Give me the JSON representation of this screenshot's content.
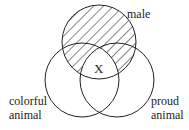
{
  "diagram": {
    "type": "venn",
    "sets": [
      {
        "id": "male",
        "label_lines": [
          "male"
        ],
        "cx": 99,
        "cy": 42,
        "r": 37
      },
      {
        "id": "colorful",
        "label_lines": [
          "colorful",
          "animal"
        ],
        "cx": 82,
        "cy": 80,
        "r": 37
      },
      {
        "id": "proud",
        "label_lines": [
          "proud",
          "animal"
        ],
        "cx": 117,
        "cy": 80,
        "r": 37
      }
    ],
    "shaded_region": "male minus (colorful ∩ proud)",
    "marker": {
      "label": "X",
      "region": "male ∩ colorful ∩ proud"
    },
    "colors": {
      "stroke": "#222222",
      "hatch": "#222222",
      "background": "#ffffff"
    }
  },
  "labels": {
    "male": "male",
    "colorful_1": "colorful",
    "colorful_2": "animal",
    "proud_1": "proud",
    "proud_2": "animal",
    "x": "X"
  }
}
